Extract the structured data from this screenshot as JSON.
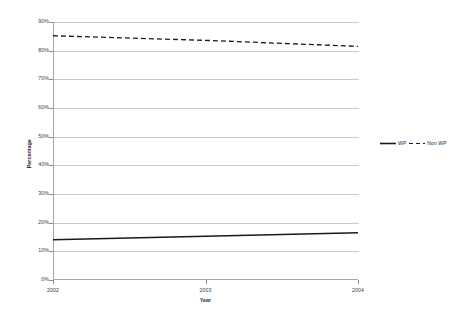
{
  "chart_data": {
    "type": "line",
    "title": "",
    "xlabel": "Year",
    "ylabel": "Percentage",
    "x": [
      2002,
      2003,
      2004
    ],
    "categories": [
      "2002",
      "2003",
      "2004"
    ],
    "xtick_labels": [
      "2002",
      "2003",
      "2004"
    ],
    "ytick_labels": [
      "0%",
      "10%",
      "20%",
      "30%",
      "40%",
      "50%",
      "60%",
      "70%",
      "80%",
      "90%"
    ],
    "ytick_values": [
      0,
      10,
      20,
      30,
      40,
      50,
      60,
      70,
      80,
      90
    ],
    "ylim": [
      0,
      90
    ],
    "xlim": [
      2002,
      2004
    ],
    "grid": "horizontal",
    "legend_position": "right",
    "series": [
      {
        "name": "WP",
        "style": "solid",
        "color": "#1a1a1a",
        "values": [
          14.0,
          15.3,
          16.5
        ]
      },
      {
        "name": "Non WP",
        "style": "dashed",
        "color": "#1a1a1a",
        "values": [
          85.2,
          83.6,
          81.5
        ]
      }
    ]
  },
  "legend": {
    "entries": [
      {
        "label": "WP",
        "style": "solid"
      },
      {
        "label": "Non WP",
        "style": "dashed"
      }
    ]
  }
}
